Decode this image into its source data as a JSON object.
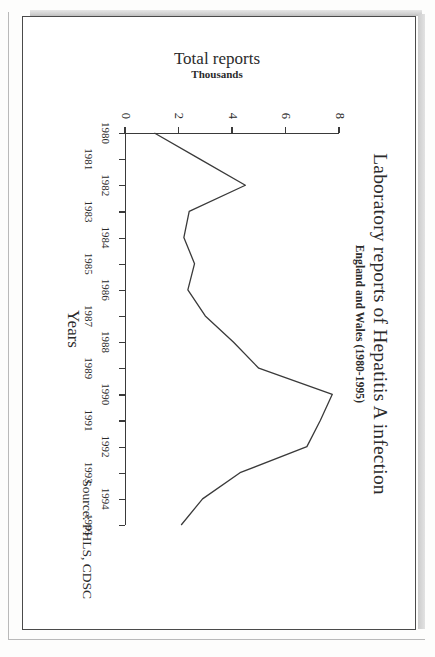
{
  "document": {
    "kind": "scanned-page",
    "page_background": "#fdfdfc",
    "card_border_color": "#4a4a4a",
    "rotation_degrees": 90
  },
  "chart_data": {
    "type": "line",
    "title": "Laboratory reports of Hepatitis A infection",
    "subtitle": "England and Wales (1980-1995)",
    "xlabel": "Years",
    "ylabel": "Total reports",
    "ylabel_units": "Thousands",
    "source": "Source: PHLS, CDSC",
    "grid": false,
    "legend": "none",
    "line_color": "#3a3a3a",
    "xlim": [
      1980,
      1995
    ],
    "ylim": [
      0,
      8
    ],
    "ytick_labels": [
      "0",
      "2",
      "4",
      "6",
      "8"
    ],
    "yticks": [
      0,
      2,
      4,
      6,
      8
    ],
    "categories": [
      "1980",
      "1981",
      "1982",
      "1983",
      "1984",
      "1985",
      "1986",
      "1987",
      "1988",
      "1989",
      "1990",
      "1991",
      "1992",
      "1993",
      "1994",
      "1995"
    ],
    "xtick_labels_row_inner": [
      "1980",
      "1982",
      "1984",
      "1986",
      "1988",
      "1990",
      "1992",
      "1994"
    ],
    "xtick_labels_row_outer": [
      "1981",
      "1983",
      "1985",
      "1987",
      "1989",
      "1991",
      "1993",
      "1995"
    ],
    "values": [
      1.1,
      2.8,
      4.5,
      2.4,
      2.2,
      2.6,
      2.35,
      3.0,
      4.05,
      5.0,
      7.75,
      7.3,
      6.8,
      4.3,
      2.9,
      2.1
    ],
    "series": [
      {
        "name": "Total reports (thousands)",
        "values": [
          1.1,
          2.8,
          4.5,
          2.4,
          2.2,
          2.6,
          2.35,
          3.0,
          4.05,
          5.0,
          7.75,
          7.3,
          6.8,
          4.3,
          2.9,
          2.1
        ]
      }
    ]
  }
}
